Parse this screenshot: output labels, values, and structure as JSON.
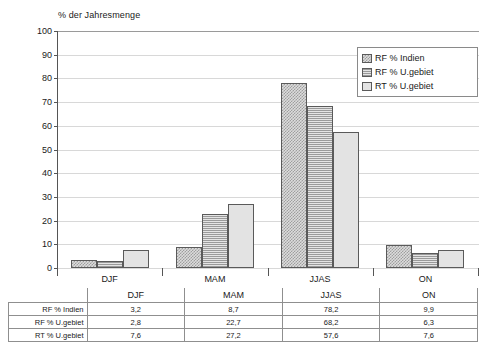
{
  "chart_data": {
    "type": "bar",
    "title": "% der Jahresmenge",
    "xlabel": "",
    "ylabel": "% der Jahresmenge",
    "ylim": [
      0,
      100
    ],
    "yticks": [
      0,
      10,
      20,
      30,
      40,
      50,
      60,
      70,
      80,
      90,
      100
    ],
    "grid": true,
    "legend_position": "top-right",
    "categories": [
      "DJF",
      "MAM",
      "JJAS",
      "ON"
    ],
    "series": [
      {
        "name": "RF % Indien",
        "values": [
          3.2,
          8.7,
          78.2,
          9.9
        ],
        "labels": [
          "3,2",
          "8,7",
          "78,2",
          "9,9"
        ],
        "pattern": "checker"
      },
      {
        "name": "RF % U.gebiet",
        "values": [
          2.8,
          22.7,
          68.2,
          6.3
        ],
        "labels": [
          "2,8",
          "22,7",
          "68,2",
          "6,3"
        ],
        "pattern": "horizontal-hatch"
      },
      {
        "name": "RT % U.gebiet",
        "values": [
          7.6,
          27.2,
          57.6,
          7.6
        ],
        "labels": [
          "7,6",
          "27,2",
          "57,6",
          "7,6"
        ],
        "pattern": "solid-light"
      }
    ]
  },
  "table": {
    "corner_label": "",
    "column_headers": [
      "DJF",
      "MAM",
      "JJAS",
      "ON"
    ],
    "rows": [
      {
        "label": "RF % Indien",
        "values": [
          "3,2",
          "8,7",
          "78,2",
          "9,9"
        ]
      },
      {
        "label": "RF % U.gebiet",
        "values": [
          "2,8",
          "22,7",
          "68,2",
          "6,3"
        ]
      },
      {
        "label": "RT % U.gebiet",
        "values": [
          "7,6",
          "27,2",
          "57,6",
          "7,6"
        ]
      }
    ]
  },
  "colors": {
    "series_1": "#9e9e9e",
    "series_2": "#9a9a9a",
    "series_3": "#e3e3e3",
    "axis": "#555555",
    "grid": "#d8d8d8"
  }
}
